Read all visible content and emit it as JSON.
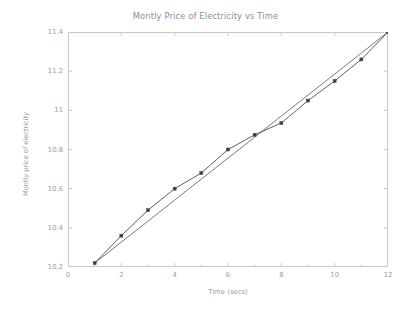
{
  "chart_data": {
    "type": "line",
    "title": "Montly Price of Electricity vs Time",
    "xlabel": "Time (secs)",
    "ylabel": "Montly price of electricity",
    "xlim": [
      0,
      12
    ],
    "ylim": [
      10.2,
      11.4
    ],
    "grid": false,
    "legend": "none",
    "x_ticks": [
      0,
      2,
      4,
      6,
      8,
      10,
      12
    ],
    "x_tick_labels": [
      "0",
      "2",
      "4",
      "6",
      "8",
      "10",
      "12"
    ],
    "x_minor_ticks": [
      1,
      3,
      5,
      7,
      9,
      11
    ],
    "y_ticks": [
      10.2,
      10.4,
      10.6,
      10.8,
      11,
      11.2,
      11.4
    ],
    "y_tick_labels": [
      "10.2",
      "10.4",
      "10.6",
      "10.8",
      "11",
      "11.2",
      "11.4"
    ],
    "x": [
      1,
      2,
      3,
      4,
      5,
      6,
      7,
      8,
      9,
      10,
      11,
      12
    ],
    "series": [
      {
        "name": "monthly price of electricity",
        "marker": "square",
        "color": "#4d4d4d",
        "values": [
          10.22,
          10.36,
          10.49,
          10.6,
          10.68,
          10.8,
          10.875,
          10.935,
          11.05,
          11.15,
          11.26,
          11.4
        ]
      },
      {
        "name": "trend line",
        "marker": "none",
        "color": "#6a6a6a",
        "values": [
          10.22,
          10.327,
          10.434,
          10.542,
          10.649,
          10.756,
          10.863,
          10.971,
          11.078,
          11.185,
          11.292,
          11.4
        ]
      }
    ],
    "colors": {
      "background": "#ffffff",
      "frame": "#c9c9c9",
      "tick_label": "#9d9d9d",
      "axis_label": "#9a9a9a",
      "title": "#8d8d8d",
      "data_line": "#4d4d4d",
      "trend_line": "#6a6a6a",
      "marker_fill": "#3f3f3f"
    }
  }
}
